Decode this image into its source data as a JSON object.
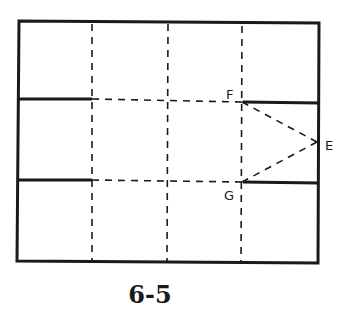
{
  "figure": {
    "caption": "6-5",
    "points": [
      {
        "label": "F",
        "x": 242,
        "y": 102
      },
      {
        "label": "E",
        "x": 317,
        "y": 142
      },
      {
        "label": "G",
        "x": 242,
        "y": 182
      }
    ],
    "line_color": "#1a1a1a"
  }
}
